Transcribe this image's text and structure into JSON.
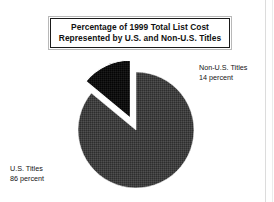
{
  "title": {
    "line1": "Percentage of 1999 Total List Cost",
    "line2": "Represented by U.S. and Non-U.S. Titles"
  },
  "labels": {
    "nonus_name": "Non-U.S. Titles",
    "nonus_value": "14 percent",
    "us_name": "U.S. Titles",
    "us_value": "86 percent"
  },
  "colors": {
    "background": "#ffffff",
    "us_slice": "#3d3d3d",
    "nonus_slice": "#111111",
    "border": "#1a1a1a",
    "border_outer": "#b8b8b8",
    "text": "#111111"
  },
  "chart_data": {
    "type": "pie",
    "title": "Percentage of 1999 Total List Cost Represented by U.S. and Non-U.S. Titles",
    "xlabel": "",
    "ylabel": "",
    "unit": "percent",
    "total": 100,
    "legend_position": "none",
    "grid": false,
    "labels_inline": true,
    "exploded_slices": [
      "Non-U.S. Titles"
    ],
    "slices": [
      {
        "name": "U.S. Titles",
        "value": 86,
        "label": "U.S. Titles",
        "value_label": "86 percent",
        "color": "#3d3d3d",
        "exploded": false
      },
      {
        "name": "Non-U.S. Titles",
        "value": 14,
        "label": "Non-U.S. Titles",
        "value_label": "14 percent",
        "color": "#111111",
        "exploded": true
      }
    ]
  }
}
